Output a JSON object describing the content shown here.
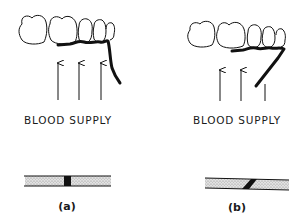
{
  "figure": {
    "panels": [
      {
        "id": "a",
        "label": "BLOOD SUPPLY",
        "caption": "(a)",
        "arrow_count": 3,
        "fracture_orientation": "vertical"
      },
      {
        "id": "b",
        "label": "BLOOD SUPPLY",
        "caption": "(b)",
        "arrow_count": 2,
        "fracture_orientation": "oblique"
      }
    ],
    "colors": {
      "ink": "#111111",
      "stipple_fill": "#d6d6d6",
      "background": "#ffffff"
    }
  }
}
